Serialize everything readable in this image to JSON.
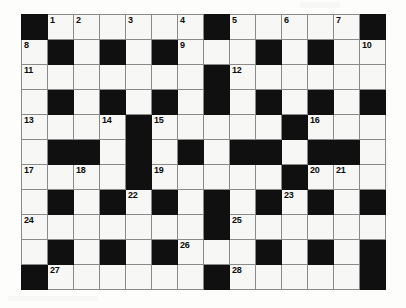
{
  "puzzle": {
    "title": "Crossword Grid",
    "type": "crossword",
    "columns": 14,
    "rows": 11,
    "cell_width_px": 26,
    "cell_height_px": 25,
    "colors": {
      "block": "#101010",
      "cell": "#f7f7f5",
      "grid_line": "#8a8a8a",
      "number": "#0b0b0b",
      "page_background": "#fdfdfc"
    },
    "legend": {
      "block_label": "blocked-square",
      "open_label": "open-square"
    },
    "clue_numbers": [
      1,
      2,
      3,
      4,
      5,
      6,
      7,
      8,
      9,
      10,
      11,
      12,
      13,
      14,
      15,
      16,
      17,
      18,
      19,
      20,
      21,
      22,
      23,
      24,
      25,
      26,
      27,
      28
    ],
    "highest_clue_number": 28,
    "grid": [
      [
        {
          "t": "block",
          "n": ""
        },
        {
          "t": "open",
          "n": "1"
        },
        {
          "t": "open",
          "n": "2"
        },
        {
          "t": "open",
          "n": ""
        },
        {
          "t": "open",
          "n": "3"
        },
        {
          "t": "open",
          "n": ""
        },
        {
          "t": "open",
          "n": "4"
        },
        {
          "t": "block",
          "n": ""
        },
        {
          "t": "open",
          "n": "5"
        },
        {
          "t": "open",
          "n": ""
        },
        {
          "t": "open",
          "n": "6"
        },
        {
          "t": "open",
          "n": ""
        },
        {
          "t": "open",
          "n": "7"
        },
        {
          "t": "block",
          "n": ""
        }
      ],
      [
        {
          "t": "open",
          "n": "8"
        },
        {
          "t": "block",
          "n": ""
        },
        {
          "t": "open",
          "n": ""
        },
        {
          "t": "block",
          "n": ""
        },
        {
          "t": "open",
          "n": ""
        },
        {
          "t": "block",
          "n": ""
        },
        {
          "t": "open",
          "n": "9"
        },
        {
          "t": "open",
          "n": ""
        },
        {
          "t": "open",
          "n": ""
        },
        {
          "t": "block",
          "n": ""
        },
        {
          "t": "open",
          "n": ""
        },
        {
          "t": "block",
          "n": ""
        },
        {
          "t": "open",
          "n": ""
        },
        {
          "t": "open",
          "n": "10"
        }
      ],
      [
        {
          "t": "open",
          "n": "11"
        },
        {
          "t": "open",
          "n": ""
        },
        {
          "t": "open",
          "n": ""
        },
        {
          "t": "open",
          "n": ""
        },
        {
          "t": "open",
          "n": ""
        },
        {
          "t": "open",
          "n": ""
        },
        {
          "t": "open",
          "n": ""
        },
        {
          "t": "block",
          "n": ""
        },
        {
          "t": "open",
          "n": "12"
        },
        {
          "t": "open",
          "n": ""
        },
        {
          "t": "open",
          "n": ""
        },
        {
          "t": "open",
          "n": ""
        },
        {
          "t": "open",
          "n": ""
        },
        {
          "t": "open",
          "n": ""
        }
      ],
      [
        {
          "t": "open",
          "n": ""
        },
        {
          "t": "block",
          "n": ""
        },
        {
          "t": "open",
          "n": ""
        },
        {
          "t": "block",
          "n": ""
        },
        {
          "t": "open",
          "n": ""
        },
        {
          "t": "block",
          "n": ""
        },
        {
          "t": "open",
          "n": ""
        },
        {
          "t": "block",
          "n": ""
        },
        {
          "t": "open",
          "n": ""
        },
        {
          "t": "block",
          "n": ""
        },
        {
          "t": "open",
          "n": ""
        },
        {
          "t": "block",
          "n": ""
        },
        {
          "t": "open",
          "n": ""
        },
        {
          "t": "block",
          "n": ""
        }
      ],
      [
        {
          "t": "open",
          "n": "13"
        },
        {
          "t": "open",
          "n": ""
        },
        {
          "t": "open",
          "n": ""
        },
        {
          "t": "open",
          "n": "14"
        },
        {
          "t": "block",
          "n": ""
        },
        {
          "t": "open",
          "n": "15"
        },
        {
          "t": "open",
          "n": ""
        },
        {
          "t": "open",
          "n": ""
        },
        {
          "t": "open",
          "n": ""
        },
        {
          "t": "open",
          "n": ""
        },
        {
          "t": "block",
          "n": ""
        },
        {
          "t": "open",
          "n": "16"
        },
        {
          "t": "open",
          "n": ""
        },
        {
          "t": "open",
          "n": ""
        }
      ],
      [
        {
          "t": "open",
          "n": ""
        },
        {
          "t": "block",
          "n": ""
        },
        {
          "t": "block",
          "n": ""
        },
        {
          "t": "open",
          "n": ""
        },
        {
          "t": "block",
          "n": ""
        },
        {
          "t": "open",
          "n": ""
        },
        {
          "t": "block",
          "n": ""
        },
        {
          "t": "open",
          "n": ""
        },
        {
          "t": "block",
          "n": ""
        },
        {
          "t": "block",
          "n": ""
        },
        {
          "t": "open",
          "n": ""
        },
        {
          "t": "block",
          "n": ""
        },
        {
          "t": "block",
          "n": ""
        },
        {
          "t": "open",
          "n": ""
        }
      ],
      [
        {
          "t": "open",
          "n": "17"
        },
        {
          "t": "open",
          "n": ""
        },
        {
          "t": "open",
          "n": "18"
        },
        {
          "t": "open",
          "n": ""
        },
        {
          "t": "block",
          "n": ""
        },
        {
          "t": "open",
          "n": "19"
        },
        {
          "t": "open",
          "n": ""
        },
        {
          "t": "open",
          "n": ""
        },
        {
          "t": "open",
          "n": ""
        },
        {
          "t": "open",
          "n": ""
        },
        {
          "t": "block",
          "n": ""
        },
        {
          "t": "open",
          "n": "20"
        },
        {
          "t": "open",
          "n": "21"
        },
        {
          "t": "open",
          "n": ""
        }
      ],
      [
        {
          "t": "open",
          "n": ""
        },
        {
          "t": "block",
          "n": ""
        },
        {
          "t": "open",
          "n": ""
        },
        {
          "t": "block",
          "n": ""
        },
        {
          "t": "open",
          "n": "22"
        },
        {
          "t": "block",
          "n": ""
        },
        {
          "t": "open",
          "n": ""
        },
        {
          "t": "block",
          "n": ""
        },
        {
          "t": "open",
          "n": ""
        },
        {
          "t": "block",
          "n": ""
        },
        {
          "t": "open",
          "n": "23"
        },
        {
          "t": "block",
          "n": ""
        },
        {
          "t": "open",
          "n": ""
        },
        {
          "t": "block",
          "n": ""
        }
      ],
      [
        {
          "t": "open",
          "n": "24"
        },
        {
          "t": "open",
          "n": ""
        },
        {
          "t": "open",
          "n": ""
        },
        {
          "t": "open",
          "n": ""
        },
        {
          "t": "open",
          "n": ""
        },
        {
          "t": "open",
          "n": ""
        },
        {
          "t": "open",
          "n": ""
        },
        {
          "t": "block",
          "n": ""
        },
        {
          "t": "open",
          "n": "25"
        },
        {
          "t": "open",
          "n": ""
        },
        {
          "t": "open",
          "n": ""
        },
        {
          "t": "open",
          "n": ""
        },
        {
          "t": "open",
          "n": ""
        },
        {
          "t": "open",
          "n": ""
        }
      ],
      [
        {
          "t": "open",
          "n": ""
        },
        {
          "t": "block",
          "n": ""
        },
        {
          "t": "open",
          "n": ""
        },
        {
          "t": "block",
          "n": ""
        },
        {
          "t": "open",
          "n": ""
        },
        {
          "t": "block",
          "n": ""
        },
        {
          "t": "open",
          "n": "26"
        },
        {
          "t": "open",
          "n": ""
        },
        {
          "t": "open",
          "n": ""
        },
        {
          "t": "block",
          "n": ""
        },
        {
          "t": "open",
          "n": ""
        },
        {
          "t": "block",
          "n": ""
        },
        {
          "t": "open",
          "n": ""
        },
        {
          "t": "block",
          "n": ""
        }
      ],
      [
        {
          "t": "block",
          "n": ""
        },
        {
          "t": "open",
          "n": "27"
        },
        {
          "t": "open",
          "n": ""
        },
        {
          "t": "open",
          "n": ""
        },
        {
          "t": "open",
          "n": ""
        },
        {
          "t": "open",
          "n": ""
        },
        {
          "t": "open",
          "n": ""
        },
        {
          "t": "block",
          "n": ""
        },
        {
          "t": "open",
          "n": "28"
        },
        {
          "t": "open",
          "n": ""
        },
        {
          "t": "open",
          "n": ""
        },
        {
          "t": "open",
          "n": ""
        },
        {
          "t": "open",
          "n": ""
        },
        {
          "t": "block",
          "n": ""
        }
      ]
    ]
  }
}
